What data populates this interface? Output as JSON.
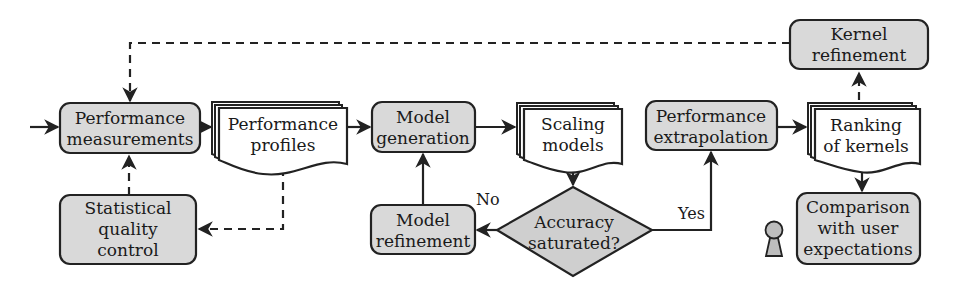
{
  "diagram": {
    "type": "flowchart",
    "colors": {
      "process_fill": "#d9d9d9",
      "document_fill": "#ffffff",
      "decision_fill": "#cfcfcf",
      "stroke": "#222222",
      "person_fill": "#bdbdbd"
    },
    "nodes": {
      "perf_measurements": {
        "kind": "process",
        "line1": "Performance",
        "line2": "measurements"
      },
      "perf_profiles": {
        "kind": "document",
        "line1": "Performance",
        "line2": "profiles"
      },
      "model_generation": {
        "kind": "process",
        "line1": "Model",
        "line2": "generation"
      },
      "scaling_models": {
        "kind": "document",
        "line1": "Scaling",
        "line2": "models"
      },
      "perf_extrapolation": {
        "kind": "process",
        "line1": "Performance",
        "line2": "extrapolation"
      },
      "ranking_kernels": {
        "kind": "document",
        "line1": "Ranking",
        "line2": "of kernels"
      },
      "kernel_refinement": {
        "kind": "process",
        "line1": "Kernel",
        "line2": "refinement"
      },
      "stat_quality": {
        "kind": "process",
        "line1": "Statistical",
        "line2": "quality",
        "line3": "control"
      },
      "model_refinement": {
        "kind": "process",
        "line1": "Model",
        "line2": "refinement"
      },
      "accuracy_decision": {
        "kind": "decision",
        "line1": "Accuracy",
        "line2": "saturated?"
      },
      "comparison": {
        "kind": "process",
        "line1": "Comparison",
        "line2": "with user",
        "line3": "expectations"
      }
    },
    "edge_labels": {
      "no": "No",
      "yes": "Yes"
    },
    "edges": [
      {
        "from": "start",
        "to": "perf_measurements",
        "style": "solid"
      },
      {
        "from": "perf_measurements",
        "to": "perf_profiles",
        "style": "solid"
      },
      {
        "from": "perf_profiles",
        "to": "model_generation",
        "style": "solid"
      },
      {
        "from": "model_generation",
        "to": "scaling_models",
        "style": "solid"
      },
      {
        "from": "scaling_models",
        "to": "accuracy_decision",
        "style": "solid"
      },
      {
        "from": "accuracy_decision",
        "to": "model_refinement",
        "style": "solid",
        "label": "No"
      },
      {
        "from": "model_refinement",
        "to": "model_generation",
        "style": "solid"
      },
      {
        "from": "accuracy_decision",
        "to": "perf_extrapolation",
        "style": "solid",
        "label": "Yes"
      },
      {
        "from": "perf_extrapolation",
        "to": "ranking_kernels",
        "style": "solid"
      },
      {
        "from": "ranking_kernels",
        "to": "comparison",
        "style": "solid"
      },
      {
        "from": "ranking_kernels",
        "to": "kernel_refinement",
        "style": "dashed"
      },
      {
        "from": "kernel_refinement",
        "to": "perf_measurements",
        "style": "dashed"
      },
      {
        "from": "perf_profiles",
        "to": "stat_quality",
        "style": "dashed"
      },
      {
        "from": "stat_quality",
        "to": "perf_measurements",
        "style": "dashed"
      }
    ],
    "icons": {
      "user": "person-icon"
    }
  }
}
